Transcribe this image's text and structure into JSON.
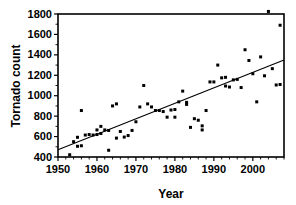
{
  "chart_data": {
    "type": "scatter",
    "title": "",
    "xlabel": "Year",
    "ylabel": "Tornado count",
    "xlim": [
      1950,
      2008
    ],
    "ylim": [
      400,
      1800
    ],
    "grid": false,
    "legend": null,
    "x_ticks": [
      1950,
      1960,
      1970,
      1980,
      1990,
      2000
    ],
    "x_tick_labels": [
      "1950",
      "1960",
      "1970",
      "1980",
      "1990",
      "2000"
    ],
    "x_minor_tick_step": 2,
    "y_ticks": [
      400,
      600,
      800,
      1000,
      1200,
      1400,
      1600,
      1800
    ],
    "y_tick_labels": [
      "400",
      "600",
      "800",
      "1000",
      "1200",
      "1400",
      "1600",
      "1800"
    ],
    "y_minor_tick_step": 100,
    "point_color": "#000000",
    "line_color": "#000000",
    "x": [
      1953,
      1954,
      1955,
      1955,
      1956,
      1956,
      1957,
      1958,
      1959,
      1960,
      1960,
      1961,
      1961,
      1962,
      1963,
      1963,
      1964,
      1965,
      1965,
      1966,
      1967,
      1968,
      1969,
      1970,
      1971,
      1972,
      1973,
      1974,
      1975,
      1976,
      1977,
      1978,
      1979,
      1980,
      1980,
      1981,
      1982,
      1983,
      1983,
      1984,
      1985,
      1986,
      1987,
      1987,
      1988,
      1989,
      1990,
      1991,
      1992,
      1993,
      1993,
      1994,
      1995,
      1996,
      1997,
      1998,
      1999,
      2000,
      2001,
      2002,
      2003,
      2004,
      2005,
      2006,
      2007,
      2007
    ],
    "y": [
      422,
      550,
      593,
      505,
      855,
      510,
      615,
      620,
      615,
      665,
      620,
      700,
      630,
      665,
      466,
      660,
      900,
      585,
      920,
      650,
      595,
      610,
      660,
      745,
      890,
      1100,
      920,
      890,
      855,
      855,
      845,
      790,
      860,
      865,
      790,
      940,
      1045,
      935,
      915,
      690,
      775,
      760,
      665,
      705,
      855,
      1135,
      1135,
      1300,
      1175,
      1180,
      1095,
      1085,
      1155,
      1160,
      1080,
      1450,
      1345,
      1215,
      940,
      1380,
      1195,
      1825,
      1265,
      1105,
      1690,
      1110
    ],
    "trend_line": {
      "x_start": 1950,
      "y_start": 470,
      "x_end": 2008,
      "y_end": 1350
    }
  },
  "axes": {
    "y_axis_title": "Tornado count",
    "x_axis_title": "Year"
  }
}
